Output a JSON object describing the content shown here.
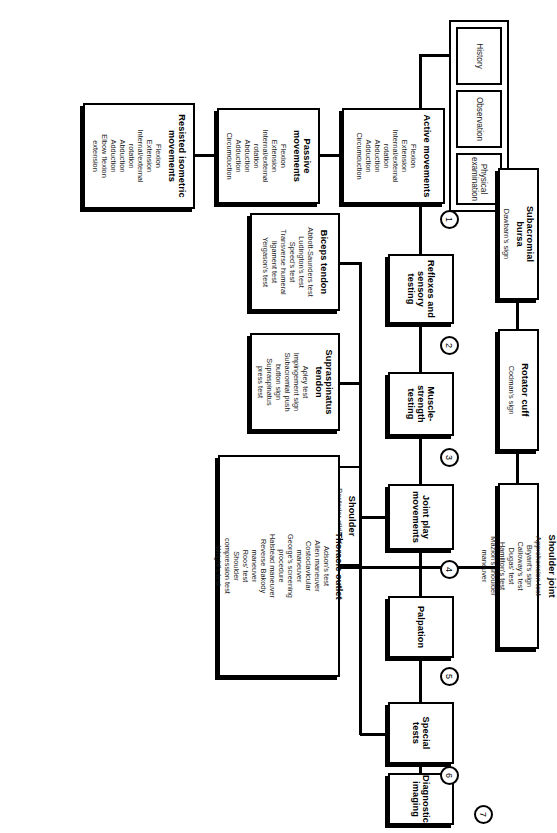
{
  "diagram": {
    "orientation": "landscape artwork rotated 90 degrees on a portrait page",
    "intake_group": {
      "items": [
        {
          "label": "History"
        },
        {
          "label": "Observation"
        },
        {
          "label": "Physical\nexamination"
        }
      ]
    },
    "steps": [
      {
        "number": "1",
        "label": "Active movements"
      },
      {
        "number": "2",
        "label": "Reflexes and\nsensory testing"
      },
      {
        "number": "3",
        "label": "Muscle-\nstrength\ntesting"
      },
      {
        "number": "4",
        "label": "Joint play\nmovements"
      },
      {
        "number": "5",
        "label": "Palpation"
      },
      {
        "number": "6",
        "label": "Special tests"
      },
      {
        "number": "7",
        "label": "Diagnostic\nimaging"
      }
    ],
    "boxes": {
      "active_movements": {
        "title": "Active movements",
        "items": "Flexion\nExtension\nInternal/external\nrotation\nAbduction\nAdduction\nCircumduction"
      },
      "passive_movements": {
        "title": "Passive\nmovements",
        "items": "Flexion\nExtension\nInternal/external\nrotation\nAbduction\nAdduction\nCircumduction"
      },
      "resisted_isometric_movements": {
        "title": "Resisted isometric\nmovements",
        "items": "Flexion\nExtension\nInternal/external\nrotation\nAbduction\nAdduction\nElbow flexion\nextension"
      },
      "reflexes_sensory": {
        "title": "Reflexes and\nsensory testing",
        "items": ""
      },
      "muscle_strength": {
        "title": "Muscle-\nstrength\ntesting",
        "items": ""
      },
      "joint_play": {
        "title": "Joint play\nmovements",
        "items": ""
      },
      "joint_play_shoulder": {
        "title": "Shoulder",
        "items": "Posterior glide of\nhumerus\nAnterior glide of\nhumerus\nLateral distraction\nLong arm traction\nAbduction\nA/C joint motion\nScapular mobility"
      },
      "palpation": {
        "title": "Palpation",
        "items": ""
      },
      "special_tests": {
        "title": "Special tests",
        "items": ""
      },
      "diagnostic_imaging": {
        "title": "Diagnostic\nimaging",
        "items": ""
      },
      "biceps_tendon": {
        "title": "Biceps tendon",
        "items": "Abbott-Saunders test\nLudington's test\nSpeed's test\nTransverse humeral\nligament test\nYergason's test"
      },
      "supraspinatus_tendon": {
        "title": "Supraspinatus\ntendon",
        "items": "Apley test\nImpingement sign\nSubacromial push\nbutton sign\nSupraspinatus\npress test"
      },
      "thoracic_outlet": {
        "title": "Thoracic outlet",
        "items": "Adson's test\nAllen maneuver\nCostoclavicular\nmaneuver\nGeorge's screening\nprocedure\nHalstead maneuver\nReverse Bakody\nmaneuver\nRoos' test\nShoulder\ncompression test\nWright's test"
      },
      "subacromial_bursa": {
        "title": "Subacromial\nbursa",
        "items": "Dawbarn's sign"
      },
      "rotator_cuff": {
        "title": "Rotator cuff",
        "items": "Codman's sign"
      },
      "shoulder_joint": {
        "title": "Shoulder joint",
        "items": "Apprehension test\nBryant's sign\nCalloway's test\nDugas' test\nHamilton's test\nMazion's shoulder\nmaneuver"
      }
    },
    "colors": {
      "stroke": "#000000",
      "background": "#ffffff",
      "text": "#1a1a1a"
    }
  }
}
